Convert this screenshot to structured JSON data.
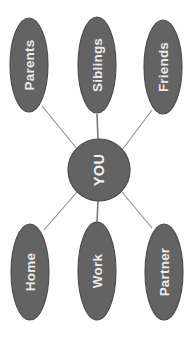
{
  "diagram": {
    "orientation": "rotated-90",
    "canvas": {
      "width": 195,
      "height": 339
    },
    "colors": {
      "background": "#fefefe",
      "node_fill": "#636363",
      "node_stroke": "#4a4a4a",
      "connector": "#8e8e8e",
      "label_text": "#ececec"
    },
    "hub": {
      "label": "YOU",
      "shape": "circle",
      "cx": 99,
      "cy": 170,
      "r": 31
    },
    "nodes": [
      {
        "id": "parents",
        "label": "Parents",
        "shape": "ellipse",
        "cx": 29,
        "cy": 65,
        "rx": 19,
        "ry": 47
      },
      {
        "id": "siblings",
        "label": "Siblings",
        "shape": "ellipse",
        "cx": 97,
        "cy": 65,
        "rx": 19,
        "ry": 48
      },
      {
        "id": "friends",
        "label": "Friends",
        "shape": "ellipse",
        "cx": 163,
        "cy": 67,
        "rx": 19,
        "ry": 47
      },
      {
        "id": "home",
        "label": "Home",
        "shape": "ellipse",
        "cx": 30,
        "cy": 272,
        "rx": 19,
        "ry": 48
      },
      {
        "id": "work",
        "label": "Work",
        "shape": "ellipse",
        "cx": 97,
        "cy": 271,
        "rx": 19,
        "ry": 49
      },
      {
        "id": "partner",
        "label": "Partner",
        "shape": "ellipse",
        "cx": 164,
        "cy": 272,
        "rx": 19,
        "ry": 48
      }
    ],
    "connectors": [
      {
        "id": "hub-parents",
        "from": "hub",
        "to": "parents",
        "x1": 78,
        "y1": 150,
        "x2": 42,
        "y2": 106,
        "weight": "thin"
      },
      {
        "id": "hub-siblings",
        "from": "hub",
        "to": "siblings",
        "x1": 98,
        "y1": 139,
        "x2": 97,
        "y2": 114,
        "weight": "thick"
      },
      {
        "id": "hub-friends",
        "from": "hub",
        "to": "friends",
        "x1": 122,
        "y1": 150,
        "x2": 152,
        "y2": 110,
        "weight": "thin"
      },
      {
        "id": "hub-home",
        "from": "hub",
        "to": "home",
        "x1": 77,
        "y1": 192,
        "x2": 44,
        "y2": 230,
        "weight": "thin"
      },
      {
        "id": "hub-work",
        "from": "hub",
        "to": "work",
        "x1": 98,
        "y1": 201,
        "x2": 97,
        "y2": 222,
        "weight": "thick"
      },
      {
        "id": "hub-partner",
        "from": "hub",
        "to": "partner",
        "x1": 122,
        "y1": 192,
        "x2": 152,
        "y2": 228,
        "weight": "thin"
      }
    ]
  }
}
